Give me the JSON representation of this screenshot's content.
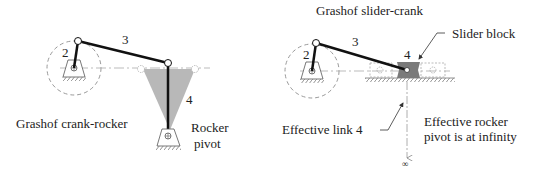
{
  "left_diagram": {
    "title": "Grashof crank-rocker",
    "link_labels": {
      "crank": "2",
      "coupler": "3",
      "rocker": "4"
    },
    "annotation_rocker_pivot_line1": "Rocker",
    "annotation_rocker_pivot_line2": "pivot"
  },
  "right_diagram": {
    "title": "Grashof slider-crank",
    "link_labels": {
      "crank": "2",
      "coupler": "3",
      "slider": "4"
    },
    "annotation_slider_block": "Slider block",
    "annotation_effective_link": "Effective link 4",
    "annotation_infinity_line1": "Effective rocker",
    "annotation_infinity_line2": "pivot is at infinity",
    "infinity_symbol": "∞"
  },
  "colors": {
    "link": "#111111",
    "swept_area": "#b8b8b8",
    "slider_block": "#7a7a7a",
    "dashed": "#999999",
    "text": "#222222"
  }
}
